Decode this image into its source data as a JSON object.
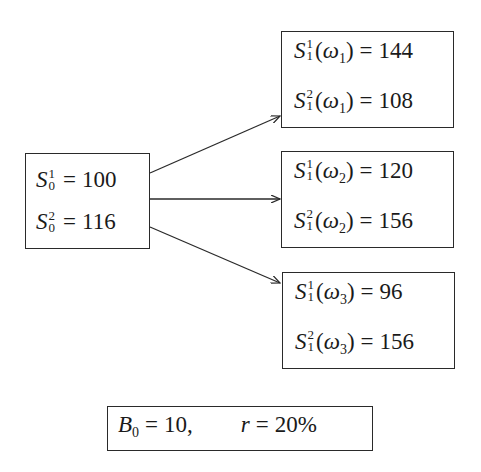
{
  "initial": {
    "lines": [
      {
        "sym": "S",
        "sup": "1",
        "sub": "0",
        "value": "100"
      },
      {
        "sym": "S",
        "sup": "2",
        "sub": "0",
        "value": "116"
      }
    ]
  },
  "outcomes": [
    {
      "state": "ω",
      "state_sub": "1",
      "lines": [
        {
          "sym": "S",
          "sup": "1",
          "sub": "1",
          "value": "144"
        },
        {
          "sym": "S",
          "sup": "2",
          "sub": "1",
          "value": "108"
        }
      ]
    },
    {
      "state": "ω",
      "state_sub": "2",
      "lines": [
        {
          "sym": "S",
          "sup": "1",
          "sub": "1",
          "value": "120"
        },
        {
          "sym": "S",
          "sup": "2",
          "sub": "1",
          "value": "156"
        }
      ]
    },
    {
      "state": "ω",
      "state_sub": "3",
      "lines": [
        {
          "sym": "S",
          "sup": "1",
          "sub": "1",
          "value": "96"
        },
        {
          "sym": "S",
          "sup": "2",
          "sub": "1",
          "value": "156"
        }
      ]
    }
  ],
  "params": {
    "bond_sym": "B",
    "bond_sub": "0",
    "bond_value": "10,",
    "rate_sym": "r",
    "rate_value": "20%"
  },
  "symbols": {
    "equals": "=",
    "lparen": "(",
    "rparen": ")"
  }
}
